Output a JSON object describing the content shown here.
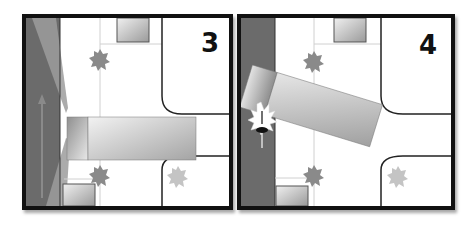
{
  "panels": [
    {
      "number": "3",
      "scene": "truck-turning-right-over-bike-lane",
      "elements": [
        "road",
        "bike-lane",
        "sidewalk",
        "truck-cab",
        "truck-trailer",
        "parked-cars",
        "trees",
        "curb-corners",
        "bicycle-arrow"
      ]
    },
    {
      "number": "4",
      "scene": "truck-collides-with-cyclist",
      "elements": [
        "road",
        "sidewalk",
        "truck-cab",
        "truck-trailer",
        "parked-cars",
        "trees",
        "curb-corners",
        "cyclist",
        "impact-burst"
      ]
    }
  ],
  "colors": {
    "frame": "#111111",
    "road": "#6e6e6e",
    "road_light": "#9a9a9a",
    "sidewalk": "#ffffff",
    "tree": "#8a8a8a",
    "tree_faded": "#c4c4c4",
    "vehicle_light": "#e6e6e6",
    "vehicle_dark": "#9e9e9e"
  }
}
